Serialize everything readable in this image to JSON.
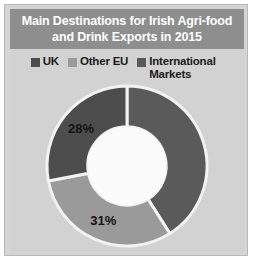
{
  "figure": {
    "title": "Main Destinations for Irish Agri-food\nand Drink Exports in 2015",
    "title_bg": "#8e8e8e",
    "panel_bg": "#d2d2d2",
    "border_color": "#b9b9b9"
  },
  "legend": {
    "position": "top",
    "items": [
      {
        "label": "UK",
        "color": "#4d4d4d",
        "swatch_name": "legend-swatch-uk"
      },
      {
        "label": "Other EU",
        "color": "#9a9a9a",
        "swatch_name": "legend-swatch-other-eu"
      },
      {
        "label": "International Markets",
        "color": "#5a5a5a",
        "swatch_name": "legend-swatch-international-markets"
      }
    ]
  },
  "chart_data": {
    "type": "pie",
    "variant": "donut",
    "title": "Main Destinations for Irish Agri-food and Drink Exports in 2015",
    "xlabel": "",
    "ylabel": "",
    "unit": "%",
    "legend_position": "top",
    "grid": false,
    "hole_ratio": 0.49,
    "start_angle_deg": 0,
    "direction": "clockwise",
    "categories": [
      "International Markets",
      "Other EU",
      "UK"
    ],
    "values": [
      41,
      31,
      28
    ],
    "slices": [
      {
        "name": "International Markets",
        "value": 41,
        "label": "",
        "label_shown": false,
        "color": "#5a5a5a",
        "start_deg": 0,
        "end_deg": 147.6
      },
      {
        "name": "Other EU",
        "value": 31,
        "label": "31%",
        "label_shown": true,
        "color": "#9a9a9a",
        "start_deg": 147.6,
        "end_deg": 259.2
      },
      {
        "name": "UK",
        "value": 28,
        "label": "28%",
        "label_shown": true,
        "color": "#4d4d4d",
        "start_deg": 259.2,
        "end_deg": 360
      }
    ],
    "visible_labels": [
      "28%",
      "31%"
    ],
    "separator_color": "#f2f2f2",
    "hole_color": "#fbfbfb"
  }
}
